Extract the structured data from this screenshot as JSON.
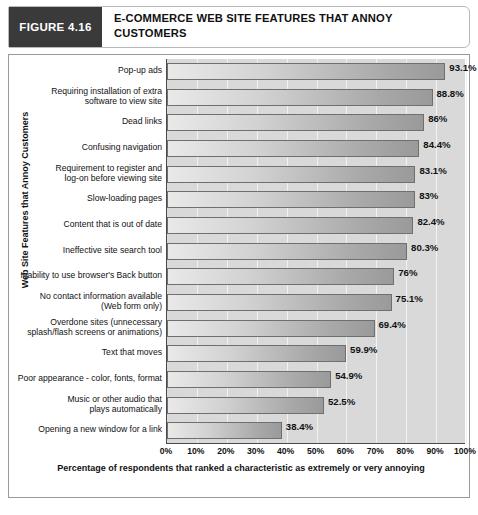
{
  "figure": {
    "tag": "FIGURE 4.16",
    "title": "E-COMMERCE WEB SITE FEATURES THAT ANNOY CUSTOMERS"
  },
  "colors": {
    "tag_background": "#3a3a3a",
    "plot_background": "#d9d9d9",
    "bar_light": "#e9e9e9",
    "bar_dark": "#9a9a9a",
    "bar_border": "#6f6f6f",
    "gridline": "#f2f2f2",
    "axis": "#4a4a4a",
    "text": "#111111"
  },
  "chart_data": {
    "type": "bar",
    "orientation": "horizontal",
    "title": "E-COMMERCE WEB SITE FEATURES THAT ANNOY CUSTOMERS",
    "xlabel": "Percentage of respondents that ranked a characteristic as extremely or very annoying",
    "ylabel": "Web Site Features that Annoy Customers",
    "xlim": [
      0,
      100
    ],
    "grid": true,
    "legend": "none",
    "xticks": [
      "0%",
      "10%",
      "20%",
      "30%",
      "40%",
      "50%",
      "60%",
      "70%",
      "80%",
      "90%",
      "100%"
    ],
    "xtick_values": [
      0,
      10,
      20,
      30,
      40,
      50,
      60,
      70,
      80,
      90,
      100
    ],
    "categories": [
      "Pop-up ads",
      "Requiring installation of extra\nsoftware to view site",
      "Dead links",
      "Confusing navigation",
      "Requirement to register and\nlog-on before viewing site",
      "Slow-loading pages",
      "Content that is out of date",
      "Ineffective site search tool",
      "Inability to use browser's Back button",
      "No contact information available\n(Web form only)",
      "Overdone sites (unnecessary\nsplash/flash screens or animations)",
      "Text that moves",
      "Poor appearance - color, fonts, format",
      "Music or other audio that\nplays automatically",
      "Opening a new window for a link"
    ],
    "values": [
      93.1,
      88.8,
      86,
      84.4,
      83.1,
      83,
      82.4,
      80.3,
      76,
      75.1,
      69.4,
      59.9,
      54.9,
      52.5,
      38.4
    ],
    "value_labels": [
      "93.1%",
      "88.8%",
      "86%",
      "84.4%",
      "83.1%",
      "83%",
      "82.4%",
      "80.3%",
      "76%",
      "75.1%",
      "69.4%",
      "59.9%",
      "54.9%",
      "52.5%",
      "38.4%"
    ]
  }
}
